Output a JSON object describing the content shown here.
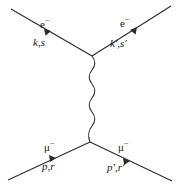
{
  "diagram": {
    "type": "feynman-diagram",
    "process": "e- mu- -> e- mu-",
    "channel": "t-channel photon exchange",
    "stroke_color": "#2b2b2b",
    "background_color": "#ffffff"
  },
  "labels": {
    "in_electron": "e",
    "in_electron_charge": "−",
    "in_electron_momentum": "k,s",
    "out_electron": "e",
    "out_electron_charge": "−",
    "out_electron_momentum": "k′,s′",
    "in_muon": "μ",
    "in_muon_charge": "−",
    "in_muon_momentum": "p,r",
    "out_muon": "μ",
    "out_muon_charge": "−",
    "out_muon_momentum": "p′,r′"
  },
  "geometry": {
    "top_vertex": {
      "x": 92,
      "y": 56
    },
    "bottom_vertex": {
      "x": 90,
      "y": 142
    },
    "in_electron_start": {
      "x": 11,
      "y": 9
    },
    "out_electron_end": {
      "x": 171,
      "y": 6
    },
    "in_muon_start": {
      "x": 8,
      "y": 180
    },
    "out_muon_end": {
      "x": 172,
      "y": 181
    },
    "photon_wave_amplitude": 3.2,
    "photon_wave_cycles": 9
  }
}
